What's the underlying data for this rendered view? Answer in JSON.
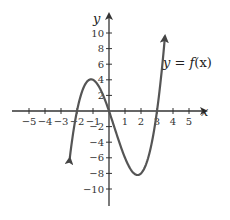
{
  "chart_data": {
    "type": "line",
    "title": "",
    "xlabel": "x",
    "ylabel": "y",
    "xlim": [
      -5.5,
      5.5
    ],
    "ylim": [
      -11.5,
      11.5
    ],
    "grid": false,
    "x_ticks": [
      -5,
      -4,
      -3,
      -2,
      -1,
      1,
      2,
      3,
      4,
      5
    ],
    "x_tick_labels": [
      "−5",
      "−4",
      "−3",
      "−2",
      "−1",
      "1",
      "2",
      "3",
      "4",
      "5"
    ],
    "y_ticks": [
      10,
      8,
      6,
      4,
      2,
      -2,
      -4,
      -6,
      -8,
      -10
    ],
    "y_tick_labels": [
      "10",
      "8",
      "6",
      "4",
      "2",
      "−2",
      "−4",
      "−6",
      "−8",
      "−10"
    ],
    "series": [
      {
        "name": "y = f(x)",
        "function": "x(x+2)(x-3)",
        "x": [
          -2.45,
          -2.0,
          -1.5,
          -1.1,
          -0.5,
          0.0,
          0.5,
          1.0,
          1.5,
          1.8,
          2.0,
          2.5,
          3.0,
          3.5
        ],
        "values": [
          -7.9,
          0.0,
          3.4,
          4.1,
          2.6,
          0.0,
          -3.1,
          -6.0,
          -7.9,
          -8.2,
          -8.0,
          -5.6,
          0.0,
          9.6
        ],
        "arrows": [
          "start",
          "end"
        ],
        "roots": [
          -2,
          0,
          3
        ],
        "local_max": [
          -1.1,
          4.1
        ],
        "local_min": [
          1.8,
          -8.2
        ]
      }
    ],
    "annotations": [
      {
        "text": "y = f(x)",
        "x": 3.7,
        "y": 6
      }
    ]
  },
  "labels": {
    "x_axis": "x",
    "y_axis": "y",
    "function": "y = f(x)",
    "fn_y": "y",
    "fn_eq": " = ",
    "fn_f": "f",
    "fn_arg": "(x)"
  }
}
